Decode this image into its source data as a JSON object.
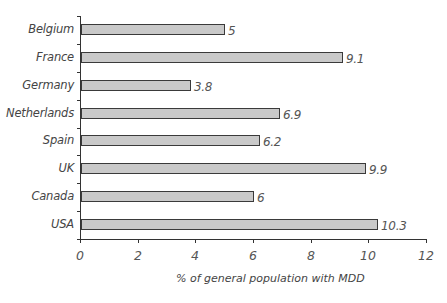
{
  "chart_data": {
    "type": "bar",
    "orientation": "horizontal",
    "title": "",
    "xlabel": "% of general population with MDD",
    "ylabel": "",
    "categories": [
      "Belgium",
      "France",
      "Germany",
      "Netherlands",
      "Spain",
      "UK",
      "Canada",
      "USA"
    ],
    "values": [
      5,
      9.1,
      3.8,
      6.9,
      6.2,
      9.9,
      6,
      10.3
    ],
    "value_labels": [
      "5",
      "9.1",
      "3.8",
      "6.9",
      "6.2",
      "9.9",
      "6",
      "10.3"
    ],
    "xlim": [
      0,
      12
    ],
    "x_ticks": [
      "0",
      "2",
      "4",
      "6",
      "8",
      "10",
      "12"
    ],
    "grid": false,
    "legend": null,
    "bar_color": "#c9c9c9",
    "bar_edge_color": "#3a3a3a"
  }
}
